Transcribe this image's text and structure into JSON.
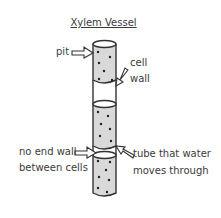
{
  "title": "Xylem Vessel",
  "labels": {
    "pit": "pit",
    "cell_wall_1": "cell",
    "cell_wall_2": "wall",
    "no_end_wall_1": "no end wall",
    "no_end_wall_2": "between cells",
    "tube_1": "tube that water",
    "tube_2": "moves through"
  },
  "colors": {
    "fill": "#d9d9d9",
    "outline": "#333333",
    "dots": "#222222"
  }
}
